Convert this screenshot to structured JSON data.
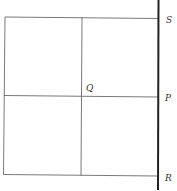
{
  "diagram": {
    "labels": {
      "S": "S",
      "Q": "Q",
      "P": "P",
      "R": "R"
    },
    "colors": {
      "line": "#555555",
      "wall": "#222222",
      "background": "#ffffff"
    }
  }
}
